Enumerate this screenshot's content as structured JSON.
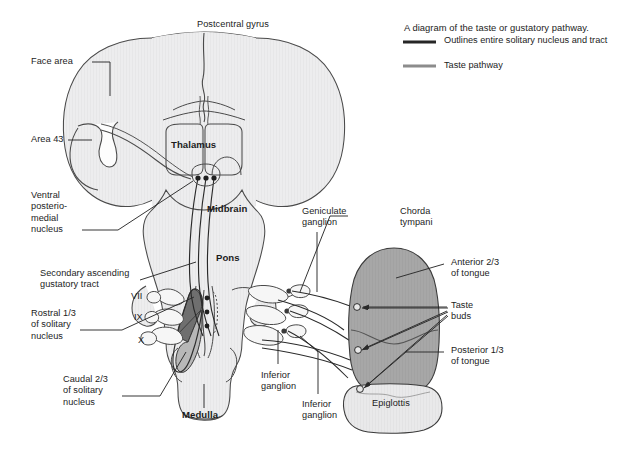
{
  "figure": {
    "title_top": "Postcentral gyrus",
    "caption": "A diagram of the taste or gustatory pathway."
  },
  "legend": {
    "items": [
      {
        "label": "Outlines entire solitary nucleus and tract",
        "color": "#262626",
        "name": "solitary-nucleus-outline"
      },
      {
        "label": "Taste pathway",
        "color": "#8c8c8c",
        "name": "taste-pathway"
      }
    ]
  },
  "labels": {
    "postcentral_gyrus": "Postcentral gyrus",
    "face_area": "Face area",
    "area_43": "Area 43",
    "ventral_posteriomedial_nucleus": "Ventral\nposterio-\nmedial\nnucleus",
    "secondary_ascending_gustatory_tract": "Secondary ascending\ngustatory tract",
    "rostral_solitary_nucleus": "Rostral 1/3\nof solitary\nnucleus",
    "caudal_solitary_nucleus": "Caudal 2/3\nof solitary\nnucleus",
    "nerve_vii": "VII",
    "nerve_ix": "IX",
    "nerve_x": "X",
    "thalamus": "Thalamus",
    "midbrain": "Midbrain",
    "pons": "Pons",
    "medulla": "Medulla",
    "geniculate_ganglion": "Geniculate\nganglion",
    "chorda_tympani": "Chorda\ntympani",
    "anterior_tongue": "Anterior 2/3\nof tongue",
    "taste_buds": "Taste\nbuds",
    "posterior_tongue": "Posterior 1/3\nof tongue",
    "inferior_ganglion_ix": "Inferior\nganglion",
    "inferior_ganglion_x": "Inferior\nganglion",
    "epiglottis": "Epiglottis"
  },
  "colors": {
    "background": "#ffffff",
    "brain_fill": "#ececed",
    "brain_stroke": "#3a3a3a",
    "tongue_fill": "#a5a5a5",
    "tongue_stroke": "#3a3a3a",
    "epiglottis_fill": "#e8e8e8",
    "solitary_rostral_fill": "#6f6f6f",
    "solitary_caudal_fill": "#b3b3b3",
    "leader_line": "#2a2a2a",
    "pathway_line": "#2a2a2a",
    "text": "#1c1c1c"
  }
}
